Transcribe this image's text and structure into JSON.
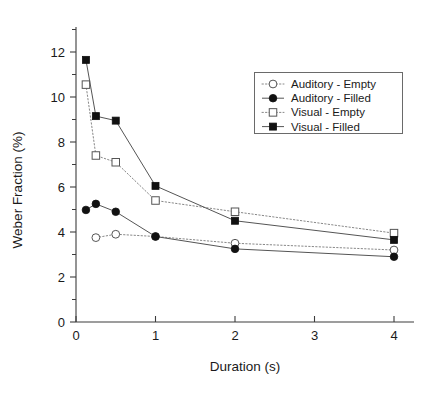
{
  "chart_data": {
    "type": "line",
    "title": "",
    "xlabel": "Duration (s)",
    "ylabel": "Weber Fraction (%)",
    "xlim": [
      0,
      4.25
    ],
    "ylim": [
      0,
      13.1
    ],
    "xticks": [
      0,
      1,
      2,
      3,
      4
    ],
    "xtick_labels": [
      "0",
      "1",
      "2",
      "3",
      "4"
    ],
    "yticks": [
      0,
      2,
      4,
      6,
      8,
      10,
      12
    ],
    "ytick_labels": [
      "0",
      "2",
      "4",
      "6",
      "8",
      "10",
      "12"
    ],
    "yminor_ticks": [
      1,
      3,
      5,
      7,
      9,
      11,
      13
    ],
    "grid": false,
    "legend_position": "upper right",
    "series": [
      {
        "name": "Auditory - Empty",
        "marker": "circle",
        "fill": "empty",
        "line": "dotted",
        "x": [
          0.25,
          0.5,
          1,
          2,
          4
        ],
        "values": [
          3.75,
          3.9,
          3.8,
          3.5,
          3.2
        ]
      },
      {
        "name": "Auditory - Filled",
        "marker": "circle",
        "fill": "filled",
        "line": "solid",
        "x": [
          0.125,
          0.25,
          0.5,
          1,
          2,
          4
        ],
        "values": [
          4.98,
          5.25,
          4.9,
          3.8,
          3.25,
          2.9
        ]
      },
      {
        "name": "Visual - Empty",
        "marker": "square",
        "fill": "empty",
        "line": "dotted",
        "x": [
          0.125,
          0.25,
          0.5,
          1,
          2,
          4
        ],
        "values": [
          10.55,
          7.4,
          7.1,
          5.4,
          4.9,
          3.95
        ]
      },
      {
        "name": "Visual - Filled",
        "marker": "square",
        "fill": "filled",
        "line": "solid",
        "x": [
          0.125,
          0.25,
          0.5,
          1,
          2,
          4
        ],
        "values": [
          11.65,
          9.15,
          8.95,
          6.05,
          4.5,
          3.65
        ]
      }
    ]
  },
  "colors": {
    "axis": "#3c3c3c",
    "solid_line": "#555555",
    "dotted_line": "#888888",
    "marker_filled": "#111111",
    "marker_empty_stroke": "#555555",
    "legend_border": "#6a6a6a",
    "background": "#ffffff"
  },
  "legend": {
    "entries": [
      {
        "label": "Auditory - Empty"
      },
      {
        "label": "Auditory - Filled"
      },
      {
        "label": "Visual - Empty"
      },
      {
        "label": "Visual - Filled"
      }
    ]
  }
}
